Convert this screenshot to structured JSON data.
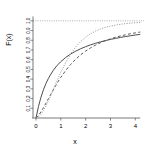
{
  "chart_data": {
    "type": "line",
    "title": "",
    "subtitle": "",
    "xlabel": "x",
    "ylabel": "F(x)",
    "xlim": [
      -0.12,
      4.35
    ],
    "ylim": [
      0.0,
      1.06
    ],
    "xticks": [
      0,
      1,
      2,
      3,
      4
    ],
    "xticklabels": [
      "0",
      "1",
      "2",
      "3",
      "4"
    ],
    "yticks": [
      0.1,
      0.2,
      0.3,
      0.4,
      0.5,
      0.6,
      0.7,
      0.8,
      0.9,
      1.0
    ],
    "yticklabels": [
      "0.1",
      "0.2",
      "0.3",
      "0.4",
      "0.5",
      "0.6",
      "0.7",
      "0.8",
      "0.9",
      "1.0"
    ],
    "grid": false,
    "legend": "none",
    "axis_color": "#555555",
    "reference_line": {
      "name": "asymptote-1.0",
      "orientation": "horizontal",
      "y": 1.0,
      "style": "dotted",
      "color": "#8a8a8a"
    },
    "x": [
      0,
      0.1,
      0.2,
      0.3,
      0.4,
      0.5,
      0.6,
      0.7,
      0.8,
      0.9,
      1.0,
      1.2,
      1.4,
      1.6,
      1.8,
      2.0,
      2.2,
      2.4,
      2.6,
      2.8,
      3.0,
      3.2,
      3.4,
      3.6,
      3.8,
      4.0,
      4.2
    ],
    "series": [
      {
        "name": "curve-solid",
        "style": "solid",
        "color": "#4d4d4d",
        "width": 1.0,
        "values": [
          0.0,
          0.118,
          0.213,
          0.29,
          0.354,
          0.407,
          0.452,
          0.491,
          0.525,
          0.554,
          0.58,
          0.624,
          0.659,
          0.688,
          0.713,
          0.734,
          0.753,
          0.769,
          0.784,
          0.797,
          0.809,
          0.819,
          0.829,
          0.838,
          0.846,
          0.854,
          0.861
        ]
      },
      {
        "name": "curve-dashed",
        "style": "dashed",
        "color": "#5a5a5a",
        "width": 1.0,
        "values": [
          0.0,
          0.026,
          0.063,
          0.106,
          0.152,
          0.199,
          0.246,
          0.292,
          0.336,
          0.378,
          0.418,
          0.49,
          0.552,
          0.605,
          0.65,
          0.689,
          0.722,
          0.75,
          0.775,
          0.796,
          0.814,
          0.83,
          0.844,
          0.856,
          0.867,
          0.876,
          0.885
        ]
      },
      {
        "name": "curve-dotted",
        "style": "dotted",
        "color": "#9a9a9a",
        "width": 1.0,
        "values": [
          0.0,
          0.012,
          0.038,
          0.076,
          0.123,
          0.177,
          0.235,
          0.295,
          0.355,
          0.414,
          0.471,
          0.574,
          0.66,
          0.731,
          0.787,
          0.832,
          0.867,
          0.895,
          0.916,
          0.933,
          0.946,
          0.956,
          0.964,
          0.971,
          0.976,
          0.98,
          0.983
        ]
      }
    ]
  }
}
